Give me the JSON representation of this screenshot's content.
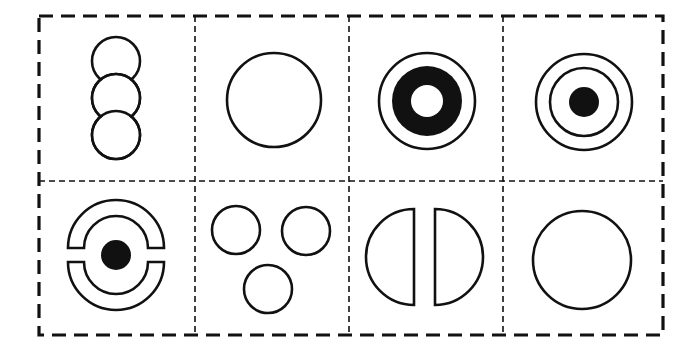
{
  "figure": {
    "colors": {
      "line": "#111111",
      "background": "#ffffff"
    },
    "grid": {
      "rows": 2,
      "cols": 4
    },
    "cells": [
      {
        "row": 1,
        "col": 1,
        "content": "three-overlapping-circles-vertical"
      },
      {
        "row": 1,
        "col": 2,
        "content": "single-large-circle"
      },
      {
        "row": 1,
        "col": 3,
        "content": "circle-with-black-ring-and-white-center"
      },
      {
        "row": 1,
        "col": 4,
        "content": "two-concentric-circles-with-black-dot"
      },
      {
        "row": 2,
        "col": 1,
        "content": "split-ring-arcs-with-black-dot"
      },
      {
        "row": 2,
        "col": 2,
        "content": "three-separate-circles-triangle"
      },
      {
        "row": 2,
        "col": 3,
        "content": "two-separated-half-circles"
      },
      {
        "row": 2,
        "col": 4,
        "content": "single-circle"
      }
    ]
  }
}
